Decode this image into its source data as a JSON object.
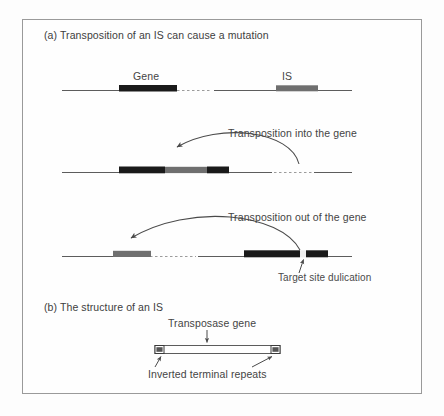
{
  "figure": {
    "panel_a": {
      "title": "(a) Transposition of an IS can cause a mutation",
      "row1": {
        "gene_label": "Gene",
        "is_label": "IS"
      },
      "arrow_caption_1": "Transposition into the gene",
      "arrow_caption_2": "Transposition out of the gene",
      "tsd_label": "Target site dulication"
    },
    "panel_b": {
      "title": "(b) The structure of an IS",
      "transposase_label": "Transposase gene",
      "itr_label": "Inverted terminal repeats"
    }
  },
  "colors": {
    "gene_black": "#1a1a1a",
    "is_gray": "#6f6f6f",
    "line_gray": "#5c5c5c",
    "frame_gray": "#9a9a9a",
    "text_gray": "#444444",
    "background": "#fdfdfd"
  }
}
